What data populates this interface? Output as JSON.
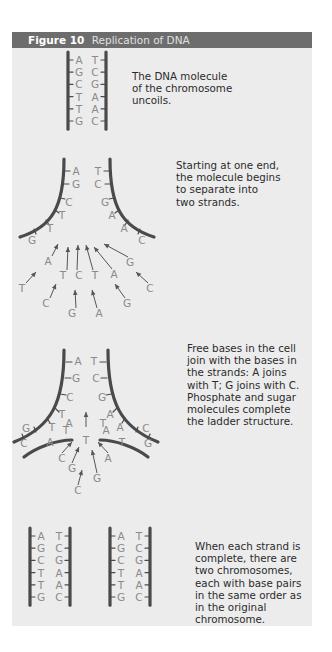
{
  "figure": {
    "number": "Figure 10",
    "title": "Replication of DNA"
  },
  "steps": [
    {
      "id": "uncoil",
      "caption_lines": [
        "The DNA molecule",
        "of the chromosome",
        "uncoils."
      ],
      "left_strand": [
        "A",
        "G",
        "C",
        "T",
        "T",
        "G"
      ],
      "right_strand": [
        "T",
        "C",
        "G",
        "A",
        "A",
        "C"
      ]
    },
    {
      "id": "separate",
      "caption_lines": [
        "Starting at one end,",
        "the molecule begins",
        "to separate into",
        "two strands."
      ],
      "left_strand": [
        "A",
        "G",
        "C",
        "T",
        "T",
        "G"
      ],
      "right_strand": [
        "T",
        "C",
        "G",
        "A",
        "A",
        "C"
      ],
      "free_bases": [
        "A",
        "T",
        "C",
        "T",
        "A",
        "G",
        "T",
        "C",
        "G",
        "A",
        "G",
        "C"
      ]
    },
    {
      "id": "join",
      "caption_lines": [
        "Free bases in the cell",
        "join with the bases in",
        "the strands: A joins",
        "with T; G joins with C.",
        "Phosphate and sugar",
        "molecules complete",
        "the ladder structure."
      ],
      "left_strand": [
        "A",
        "G",
        "C",
        "T",
        "T",
        "G",
        "C"
      ],
      "left_new": [
        "T",
        "A",
        "A"
      ],
      "right_strand": [
        "T",
        "C",
        "G",
        "A",
        "A",
        "C",
        "G"
      ],
      "right_new": [
        "A",
        "T",
        "T"
      ],
      "free_bases": [
        "T",
        "C",
        "G",
        "A",
        "G",
        "C"
      ]
    },
    {
      "id": "complete",
      "caption_lines": [
        "When each strand is",
        "complete, there are",
        "two chromosomes,",
        "each with base pairs",
        "in the same order as",
        "in the original",
        "chromosome."
      ],
      "chromosome_1": {
        "left": [
          "A",
          "G",
          "C",
          "T",
          "T",
          "G"
        ],
        "right": [
          "T",
          "C",
          "G",
          "A",
          "A",
          "C"
        ]
      },
      "chromosome_2": {
        "left": [
          "A",
          "G",
          "C",
          "T",
          "T",
          "G"
        ],
        "right": [
          "T",
          "C",
          "G",
          "A",
          "A",
          "C"
        ]
      }
    }
  ],
  "colors": {
    "header_bg": "#6d6d6d",
    "panel_bg": "#ececec",
    "backbone": "#4a4a4a",
    "base_text": "#8a8a8a",
    "caption_text": "#2b2b2b"
  }
}
